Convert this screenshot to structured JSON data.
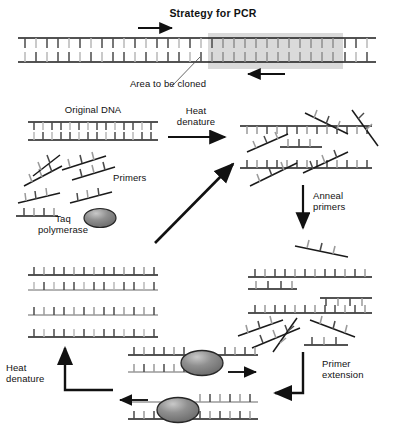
{
  "figure": {
    "title": "Strategy for PCR",
    "width": 393,
    "height": 432,
    "colors": {
      "line": "#1a1a1a",
      "rung_dark": "#4a4a4a",
      "rung_light": "#b8b8b8",
      "highlight_box": "#cfcfcf",
      "enzyme_fill": "#8c8c8c",
      "enzyme_stroke": "#262626",
      "background": "#ffffff"
    }
  },
  "labels": {
    "title": "Strategy for PCR",
    "area_to_be_cloned": "Area to be cloned",
    "original_dna": "Original DNA",
    "heat_denature_top": "Heat\ndenature",
    "primers": "Primers",
    "taq_polymerase": "Taq\npolymerase",
    "anneal_primers": "Anneal\nprimers",
    "primer_extension": "Primer\nextension",
    "heat_denature_bottom": "Heat\ndenature"
  },
  "steps": [
    {
      "id": "strategy",
      "label": "Strategy for PCR",
      "note": "Area to be cloned"
    },
    {
      "id": "original-dna",
      "label": "Original DNA"
    },
    {
      "id": "heat-denature-1",
      "label": "Heat denature"
    },
    {
      "id": "anneal",
      "label": "Anneal primers"
    },
    {
      "id": "extension",
      "label": "Primer extension"
    },
    {
      "id": "heat-denature-2",
      "label": "Heat denature"
    }
  ],
  "reagents": [
    {
      "id": "primers",
      "label": "Primers"
    },
    {
      "id": "taq-polymerase",
      "label": "Taq polymerase"
    }
  ]
}
